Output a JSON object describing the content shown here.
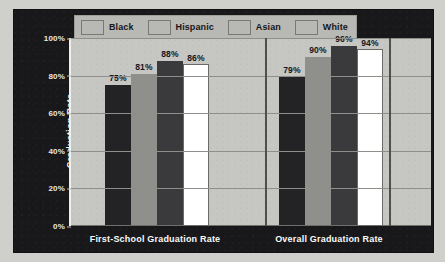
{
  "chart_data": {
    "type": "bar",
    "title": "",
    "subtitle": "",
    "xlabel": "",
    "ylabel": "Graduation Rate",
    "ylim": [
      0,
      100
    ],
    "yticks": [
      "0%",
      "20%",
      "40%",
      "60%",
      "80%",
      "100%"
    ],
    "ytick_values": [
      0,
      20,
      40,
      60,
      80,
      100
    ],
    "grid": true,
    "legend_position": "top-left",
    "categories": [
      "First-School Graduation Rate",
      "Overall Graduation Rate"
    ],
    "series": [
      {
        "name": "Black",
        "color": "#232326",
        "values": [
          75,
          81
        ],
        "labels": [
          "75%",
          "79%"
        ]
      },
      {
        "name": "Hispanic",
        "color": "#8f8f8c",
        "values": [
          81,
          90
        ],
        "labels": [
          "81%",
          "90%"
        ]
      },
      {
        "name": "Asian",
        "color": "#3a3a3d",
        "values": [
          88,
          96
        ],
        "labels": [
          "88%",
          "96%"
        ]
      },
      {
        "name": "White",
        "color": "#ffffff",
        "values": [
          86,
          94
        ],
        "labels": [
          "86%",
          "94%"
        ]
      }
    ],
    "groups": [
      {
        "category": "First-School Graduation Rate",
        "bars": [
          {
            "series": "Black",
            "value": 75,
            "label": "75%"
          },
          {
            "series": "Hispanic",
            "value": 81,
            "label": "81%"
          },
          {
            "series": "Asian",
            "value": 88,
            "label": "88%"
          },
          {
            "series": "White",
            "value": 86,
            "label": "86%"
          }
        ]
      },
      {
        "category": "Overall Graduation Rate",
        "bars": [
          {
            "series": "Black",
            "value": 79,
            "label": "79%"
          },
          {
            "series": "Hispanic",
            "value": 90,
            "label": "90%"
          },
          {
            "series": "Asian",
            "value": 96,
            "label": "96%"
          },
          {
            "series": "White",
            "value": 94,
            "label": "94%"
          }
        ]
      }
    ]
  },
  "legend": {
    "items": [
      {
        "label": "Black",
        "color": "#232326"
      },
      {
        "label": "Hispanic",
        "color": "#8f8f8c"
      },
      {
        "label": "Asian",
        "color": "#3a3a3d"
      },
      {
        "label": "White",
        "color": "#ffffff"
      }
    ]
  },
  "axis": {
    "y_title": "Graduation Rate",
    "y_ticks": [
      "100%",
      "80%",
      "60%",
      "40%",
      "20%",
      "0%"
    ]
  },
  "x_labels": [
    "First-School Graduation Rate",
    "Overall Graduation Rate"
  ],
  "colors": {
    "panel_background": "#18181a",
    "plot_background": "#c6c6c2",
    "gridline": "#8e8e8a",
    "tick_text": "#e8e8e6",
    "value_text": "#15151a"
  }
}
